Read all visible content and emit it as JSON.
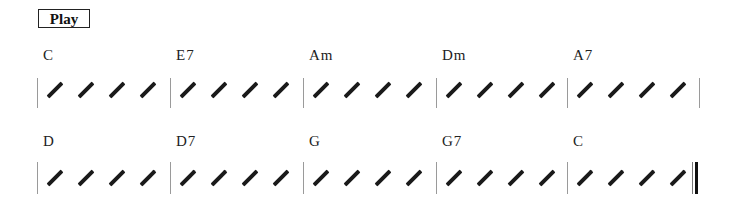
{
  "toolbar": {
    "play_label": "Play"
  },
  "rows": [
    {
      "measures": [
        {
          "chord": "C",
          "beats": 4
        },
        {
          "chord": "E7",
          "beats": 4
        },
        {
          "chord": "Am",
          "beats": 4
        },
        {
          "chord": "Dm",
          "beats": 4
        },
        {
          "chord": "A7",
          "beats": 4
        }
      ],
      "end": "single"
    },
    {
      "measures": [
        {
          "chord": "D",
          "beats": 4
        },
        {
          "chord": "D7",
          "beats": 4
        },
        {
          "chord": "G",
          "beats": 4
        },
        {
          "chord": "G7",
          "beats": 4
        },
        {
          "chord": "C",
          "beats": 4
        }
      ],
      "end": "final"
    }
  ]
}
